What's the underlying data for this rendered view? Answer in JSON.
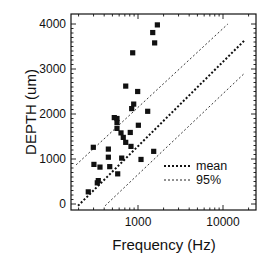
{
  "chart_data": {
    "type": "scatter",
    "title": "",
    "xlabel": "Frequency (Hz)",
    "ylabel": "DEPTH (um)",
    "xscale": "log",
    "xlim": [
      163,
      24500
    ],
    "ylim": [
      -150,
      4200
    ],
    "xticks": [
      1000,
      10000
    ],
    "xtick_labels": [
      "1000",
      "10000"
    ],
    "yticks": [
      0,
      1000,
      2000,
      3000,
      4000
    ],
    "ytick_labels": [
      "0",
      "1000",
      "2000",
      "3000",
      "4000"
    ],
    "grid": false,
    "legend_position": "lower right",
    "series": [
      {
        "name": "measurements",
        "marker": "square",
        "color": "#111111",
        "points": [
          [
            1690,
            3980
          ],
          [
            1490,
            3810
          ],
          [
            1570,
            3580
          ],
          [
            866,
            3360
          ],
          [
            717,
            2620
          ],
          [
            991,
            2500
          ],
          [
            890,
            2220
          ],
          [
            843,
            2120
          ],
          [
            1300,
            2060
          ],
          [
            526,
            1920
          ],
          [
            566,
            1900
          ],
          [
            566,
            1810
          ],
          [
            566,
            1680
          ],
          [
            1010,
            1750
          ],
          [
            631,
            1580
          ],
          [
            811,
            1590
          ],
          [
            671,
            1480
          ],
          [
            717,
            1370
          ],
          [
            827,
            1280
          ],
          [
            1530,
            1170
          ],
          [
            298,
            1260
          ],
          [
            448,
            1220
          ],
          [
            448,
            1040
          ],
          [
            643,
            1020
          ],
          [
            1085,
            990
          ],
          [
            303,
            880
          ],
          [
            357,
            820
          ],
          [
            465,
            830
          ],
          [
            577,
            670
          ],
          [
            341,
            520
          ],
          [
            332,
            470
          ],
          [
            260,
            270
          ]
        ]
      },
      {
        "name": "mean",
        "style": "dotted-bold",
        "color": "#111111",
        "points": [
          [
            197,
            -40
          ],
          [
            18000,
            3640
          ]
        ]
      },
      {
        "name": "95%",
        "style": "dotted-thin",
        "color": "#222222",
        "points": [
          [
            187,
            870
          ],
          [
            11400,
            4000
          ]
        ]
      },
      {
        "name": "95%",
        "style": "dotted-thin",
        "color": "#222222",
        "points": [
          [
            410,
            -40
          ],
          [
            18000,
            2910
          ]
        ]
      }
    ],
    "legend": [
      {
        "label": "mean",
        "style": "dotted-bold"
      },
      {
        "label": "95%",
        "style": "dotted-thin"
      }
    ]
  }
}
